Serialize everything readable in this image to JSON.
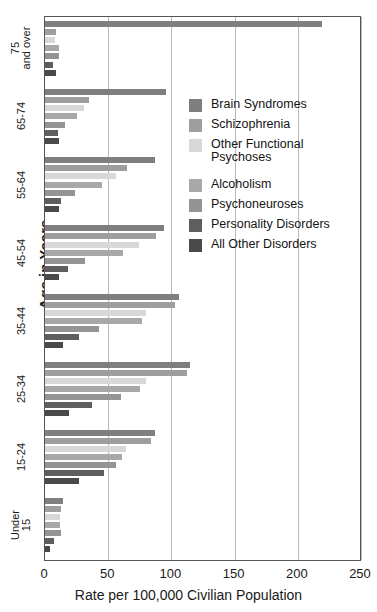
{
  "chart_data": {
    "type": "bar",
    "orientation": "horizontal",
    "title": "",
    "xlabel": "Rate per 100,000 Civilian Population",
    "ylabel": "Age in Years",
    "xlim": [
      0,
      250
    ],
    "xticks": [
      0,
      50,
      100,
      150,
      200,
      250
    ],
    "grid": "vertical",
    "legend_position": "inside-upper-right",
    "categories": [
      "75 and over",
      "65-74",
      "55-64",
      "45-54",
      "35-44",
      "25-34",
      "15-24",
      "Under 15"
    ],
    "category_labels_display": [
      [
        "75",
        "and over"
      ],
      [
        "65-74"
      ],
      [
        "55-64"
      ],
      [
        "45-54"
      ],
      [
        "35-44"
      ],
      [
        "25-34"
      ],
      [
        "15-24"
      ],
      [
        "Under",
        "15"
      ]
    ],
    "series": [
      {
        "name": "Brain Syndromes",
        "color": "#7f7f7f",
        "values": [
          219,
          96,
          87,
          94,
          106,
          115,
          87,
          14
        ]
      },
      {
        "name": "Schizophrenia",
        "color": "#9e9e9e",
        "values": [
          9,
          35,
          65,
          88,
          103,
          112,
          84,
          13
        ]
      },
      {
        "name": "Other Functional Psychoses",
        "color": "#d8d8d8",
        "values": [
          8,
          31,
          56,
          74,
          80,
          80,
          64,
          12
        ]
      },
      {
        "name": "Alcoholism",
        "color": "#a8a8a8",
        "values": [
          11,
          25,
          45,
          62,
          77,
          75,
          61,
          12
        ]
      },
      {
        "name": "Psychoneuroses",
        "color": "#949494",
        "values": [
          11,
          16,
          24,
          32,
          43,
          60,
          56,
          13
        ]
      },
      {
        "name": "Personality Disorders",
        "color": "#5e5e5e",
        "values": [
          6,
          10,
          13,
          18,
          27,
          37,
          47,
          7
        ]
      },
      {
        "name": "All Other Disorders",
        "color": "#4a4a4a",
        "values": [
          9,
          11,
          11,
          11,
          14,
          19,
          27,
          4
        ]
      }
    ]
  },
  "legend": {
    "entries": [
      {
        "label": "Brain Syndromes"
      },
      {
        "label": "Schizophrenia"
      },
      {
        "label": "Other Functional\nPsychoses"
      },
      {
        "label": "Alcoholism"
      },
      {
        "label": "Psychoneuroses"
      },
      {
        "label": "Personality Disorders"
      },
      {
        "label": "All Other Disorders"
      }
    ]
  },
  "axis": {
    "y_title": "Age in Years",
    "x_title": "Rate per 100,000 Civilian Population",
    "x_tick_labels": [
      "0",
      "50",
      "100",
      "150",
      "200",
      "250"
    ]
  }
}
